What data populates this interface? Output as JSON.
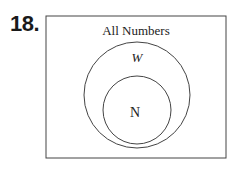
{
  "problem_number": "18.",
  "diagram": {
    "type": "venn",
    "universe_label": "All Numbers",
    "sets": [
      {
        "label": "W",
        "contains": "N"
      },
      {
        "label": "N"
      }
    ]
  }
}
